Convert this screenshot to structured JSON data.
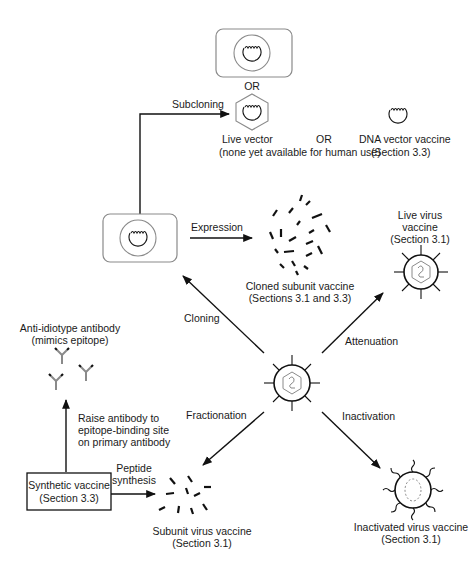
{
  "figure": {
    "nodes": {
      "top_cell": {
        "alt_label": "OR"
      },
      "live_vector": {
        "line1": "Live vector",
        "line2": "(none yet available for human use)"
      },
      "or_between": "OR",
      "dna_vector": {
        "line1": "DNA vector vaccine",
        "line2": "(Section 3.3)"
      },
      "cloned_subunit": {
        "line1": "Cloned subunit vaccine",
        "line2": "(Sections 3.1 and 3.3)"
      },
      "live_virus": {
        "line1": "Live virus",
        "line2": "vaccine",
        "line3": "(Section 3.1)"
      },
      "anti_idiotype": {
        "line1": "Anti-idiotype antibody",
        "line2": "(mimics epitope)"
      },
      "synthetic": {
        "line1": "Synthetic vaccine",
        "line2": "(Section 3.3)"
      },
      "subunit_virus": {
        "line1": "Subunit virus vaccine",
        "line2": "(Section 3.1)"
      },
      "inactivated": {
        "line1": "Inactivated virus vaccine",
        "line2": "(Section 3.1)"
      }
    },
    "edges": {
      "subcloning": "Subcloning",
      "expression": "Expression",
      "cloning": "Cloning",
      "attenuation": "Attenuation",
      "fractionation": "Fractionation",
      "inactivation": "Inactivation",
      "raise_antibody": {
        "line1": "Raise antibody to",
        "line2": "epitope-binding site",
        "line3": "on primary antibody"
      },
      "peptide_synthesis": {
        "line1": "Peptide",
        "line2": "synthesis"
      }
    },
    "colors": {
      "ink": "#111111",
      "grey": "#8a8a8a",
      "background": "#ffffff"
    }
  }
}
